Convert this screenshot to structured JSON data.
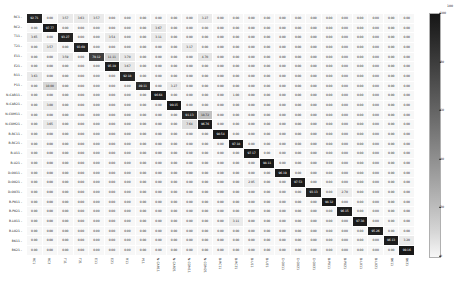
{
  "chart_data": {
    "type": "heatmap",
    "title": "",
    "subtitle": "",
    "xlabel": "",
    "ylabel": "",
    "grid": false,
    "legend_position": "right",
    "colorbar": {
      "min": 0,
      "max": 100,
      "ticks": [
        100,
        80,
        60,
        40,
        20,
        0
      ],
      "low_color": "#f7f7f7",
      "high_color": "#1a1a1a",
      "top_label": "100"
    },
    "cell_text_format": "0.00",
    "diagonal_highlight": true,
    "categories": [
      "RC1",
      "RC2",
      "T11",
      "T21",
      "E11",
      "E21",
      "R11",
      "P11",
      "N-CAR11",
      "N-CAR21",
      "N-COM11",
      "N-COM21",
      "B-RC11",
      "B-RC21",
      "B-U11",
      "B-U21",
      "D-O011",
      "D-O021",
      "D-O031",
      "B-P011",
      "B-P021",
      "B-L011",
      "B-L021",
      "BK11",
      "BK21"
    ],
    "x": [
      "RC1",
      "RC2",
      "T11",
      "T21",
      "E11",
      "E21",
      "R11",
      "P11",
      "N-CAR11",
      "N-CAR21",
      "N-COM11",
      "N-COM21",
      "B-RC11",
      "B-RC21",
      "B-U11",
      "B-U21",
      "D-O011",
      "D-O021",
      "D-O031",
      "B-P011",
      "B-P021",
      "B-L011",
      "B-L021",
      "BK11",
      "BK21"
    ],
    "y": [
      "RC1",
      "RC2",
      "T11",
      "T21",
      "E11",
      "E21",
      "R11",
      "P11",
      "N-CAR11",
      "N-CAR21",
      "N-COM11",
      "N-COM21",
      "B-RC11",
      "B-RC21",
      "B-U11",
      "B-U21",
      "D-O011",
      "D-O021",
      "D-O031",
      "B-P011",
      "B-P021",
      "B-L011",
      "B-L021",
      "BK11",
      "BK21"
    ],
    "values": [
      [
        92.71,
        0.0,
        3.57,
        3.63,
        3.57,
        0.0,
        0.0,
        0.0,
        0.0,
        0.0,
        0.0,
        3.27,
        0.0,
        0.0,
        0.0,
        0.0,
        0.0,
        0.0,
        0.0,
        0.0,
        0.0,
        0.0,
        0.0,
        0.0,
        0.0
      ],
      [
        0.0,
        97.77,
        0.0,
        0.0,
        0.0,
        0.0,
        0.0,
        0.0,
        3.67,
        0.0,
        0.0,
        0.0,
        0.0,
        0.0,
        0.0,
        0.0,
        0.0,
        0.0,
        0.0,
        0.0,
        0.0,
        0.0,
        0.0,
        0.0,
        0.0
      ],
      [
        3.65,
        0.0,
        93.27,
        0.0,
        0.0,
        3.54,
        0.0,
        0.0,
        3.11,
        0.0,
        0.0,
        0.0,
        0.0,
        0.0,
        0.0,
        0.0,
        0.0,
        0.0,
        0.0,
        0.0,
        0.0,
        0.0,
        0.0,
        0.0,
        0.0
      ],
      [
        0.0,
        3.57,
        0.0,
        93.69,
        0.0,
        0.0,
        0.0,
        0.0,
        0.0,
        0.0,
        3.17,
        0.0,
        0.0,
        0.0,
        0.0,
        0.0,
        0.0,
        0.0,
        0.0,
        0.0,
        0.0,
        0.0,
        0.0,
        0.0,
        0.0
      ],
      [
        0.0,
        0.0,
        3.59,
        0.0,
        79.12,
        11.11,
        3.7,
        0.0,
        0.0,
        0.0,
        0.0,
        4.7,
        0.0,
        0.0,
        0.0,
        0.0,
        0.0,
        0.0,
        0.0,
        0.0,
        0.0,
        0.0,
        0.0,
        0.0,
        0.0
      ],
      [
        0.0,
        0.0,
        0.0,
        0.0,
        0.0,
        95.19,
        3.67,
        0.0,
        0.0,
        0.0,
        0.0,
        0.0,
        0.0,
        0.0,
        0.0,
        0.0,
        0.0,
        0.0,
        0.0,
        0.0,
        0.0,
        0.0,
        0.0,
        0.0,
        0.0
      ],
      [
        3.63,
        0.0,
        0.0,
        0.0,
        0.0,
        0.0,
        92.18,
        0.0,
        0.0,
        0.0,
        0.0,
        0.0,
        0.0,
        0.0,
        0.0,
        0.0,
        0.0,
        0.0,
        0.0,
        0.0,
        0.0,
        0.0,
        0.0,
        0.0,
        0.0
      ],
      [
        0.0,
        10.0,
        0.0,
        0.0,
        0.0,
        0.0,
        0.0,
        89.11,
        0.0,
        3.27,
        0.0,
        0.0,
        0.0,
        0.0,
        0.0,
        0.0,
        0.0,
        0.0,
        0.0,
        0.0,
        0.0,
        0.0,
        0.0,
        0.0,
        0.0
      ],
      [
        0.0,
        0.0,
        0.0,
        0.0,
        0.0,
        0.0,
        0.0,
        0.0,
        96.64,
        0.0,
        0.0,
        0.0,
        0.0,
        1.0,
        0.0,
        0.0,
        0.0,
        0.0,
        0.0,
        0.0,
        0.0,
        0.0,
        0.0,
        0.0,
        0.0
      ],
      [
        0.0,
        3.0,
        0.0,
        0.0,
        0.0,
        0.0,
        0.0,
        0.0,
        0.0,
        99.15,
        0.0,
        0.0,
        0.0,
        0.0,
        0.0,
        0.0,
        0.0,
        0.0,
        0.0,
        0.0,
        0.0,
        0.0,
        0.0,
        0.0,
        0.0
      ],
      [
        0.0,
        0.0,
        0.0,
        0.0,
        0.0,
        0.0,
        0.0,
        0.0,
        0.0,
        0.0,
        91.13,
        18.72,
        0.0,
        0.0,
        0.0,
        0.0,
        0.0,
        0.0,
        0.0,
        0.0,
        0.0,
        0.0,
        0.0,
        0.0,
        0.0
      ],
      [
        0.0,
        3.65,
        0.0,
        0.0,
        0.0,
        0.0,
        0.0,
        0.0,
        0.0,
        0.0,
        7.64,
        96.76,
        0.0,
        0.0,
        0.0,
        0.0,
        0.0,
        0.0,
        0.0,
        0.0,
        0.0,
        0.0,
        0.0,
        0.0,
        0.0
      ],
      [
        0.0,
        0.0,
        0.0,
        0.0,
        0.0,
        0.0,
        0.0,
        0.0,
        0.0,
        0.0,
        0.0,
        0.0,
        98.54,
        0.0,
        0.0,
        0.0,
        0.0,
        0.0,
        0.0,
        0.0,
        0.0,
        0.0,
        0.0,
        0.0,
        0.0
      ],
      [
        0.0,
        0.0,
        0.0,
        0.0,
        0.0,
        0.0,
        0.0,
        0.0,
        0.0,
        0.0,
        0.0,
        0.0,
        0.0,
        97.18,
        0.0,
        0.0,
        0.0,
        0.0,
        0.0,
        0.0,
        0.0,
        0.0,
        0.0,
        0.0,
        0.0
      ],
      [
        0.0,
        0.0,
        0.0,
        0.0,
        0.0,
        0.0,
        0.0,
        0.0,
        0.0,
        0.0,
        0.0,
        0.0,
        0.0,
        0.0,
        97.17,
        0.0,
        0.0,
        0.0,
        0.0,
        0.0,
        0.0,
        0.0,
        0.0,
        0.0,
        0.0
      ],
      [
        0.0,
        0.0,
        0.0,
        0.0,
        0.0,
        0.0,
        0.0,
        0.0,
        0.0,
        0.0,
        0.0,
        0.0,
        0.0,
        0.0,
        0.0,
        98.11,
        0.0,
        0.0,
        0.0,
        0.0,
        0.0,
        0.0,
        0.0,
        0.0,
        0.0
      ],
      [
        0.0,
        0.0,
        0.0,
        0.0,
        0.0,
        0.0,
        0.0,
        0.0,
        0.0,
        0.0,
        0.0,
        0.0,
        0.0,
        0.0,
        0.0,
        0.0,
        96.19,
        0.0,
        0.0,
        0.0,
        0.0,
        0.0,
        0.0,
        0.0,
        0.0
      ],
      [
        0.0,
        0.0,
        0.0,
        0.0,
        0.0,
        0.0,
        0.0,
        0.0,
        0.0,
        0.0,
        0.0,
        0.0,
        0.0,
        0.0,
        2.05,
        0.0,
        0.0,
        97.53,
        0.0,
        0.0,
        0.0,
        0.0,
        0.0,
        0.0,
        0.0
      ],
      [
        0.0,
        0.0,
        0.0,
        0.0,
        0.0,
        0.0,
        0.0,
        0.0,
        0.0,
        0.0,
        0.0,
        0.0,
        0.0,
        0.0,
        0.0,
        0.0,
        0.0,
        0.0,
        93.13,
        0.0,
        2.7,
        0.0,
        0.0,
        0.0,
        0.0
      ],
      [
        0.0,
        0.0,
        0.0,
        0.0,
        0.0,
        0.0,
        0.0,
        0.0,
        0.0,
        0.0,
        0.0,
        0.0,
        0.0,
        0.0,
        0.0,
        0.0,
        0.0,
        0.0,
        0.0,
        98.32,
        0.0,
        0.0,
        0.0,
        0.0,
        0.0
      ],
      [
        0.0,
        0.0,
        0.0,
        0.0,
        0.0,
        0.0,
        0.0,
        0.0,
        0.0,
        0.0,
        0.0,
        0.0,
        0.0,
        0.0,
        0.0,
        0.0,
        0.0,
        0.0,
        0.0,
        0.0,
        96.15,
        0.0,
        0.0,
        0.0,
        0.0
      ],
      [
        0.0,
        0.0,
        0.0,
        0.0,
        0.0,
        0.0,
        0.0,
        0.0,
        0.0,
        0.0,
        0.0,
        0.0,
        0.0,
        3.11,
        0.0,
        0.0,
        0.0,
        0.0,
        0.0,
        0.0,
        0.0,
        97.38,
        0.0,
        0.0,
        0.0
      ],
      [
        0.0,
        0.0,
        0.0,
        0.0,
        0.0,
        0.0,
        0.0,
        0.0,
        0.0,
        0.0,
        0.0,
        0.0,
        0.0,
        0.0,
        0.0,
        0.0,
        0.0,
        0.0,
        0.0,
        0.0,
        0.0,
        0.0,
        95.26,
        0.0,
        0.0
      ],
      [
        0.0,
        0.0,
        0.0,
        0.0,
        0.0,
        0.0,
        0.0,
        0.0,
        0.0,
        0.0,
        0.0,
        0.0,
        0.0,
        0.0,
        0.0,
        0.0,
        0.0,
        0.0,
        0.0,
        0.0,
        0.0,
        0.0,
        0.0,
        96.13,
        3.2
      ],
      [
        0.0,
        0.0,
        0.0,
        0.0,
        0.0,
        0.0,
        0.0,
        0.0,
        0.0,
        0.0,
        0.0,
        0.0,
        0.0,
        0.0,
        0.0,
        0.0,
        0.0,
        0.0,
        0.0,
        0.0,
        0.0,
        0.0,
        0.0,
        0.0,
        99.16
      ]
    ]
  }
}
